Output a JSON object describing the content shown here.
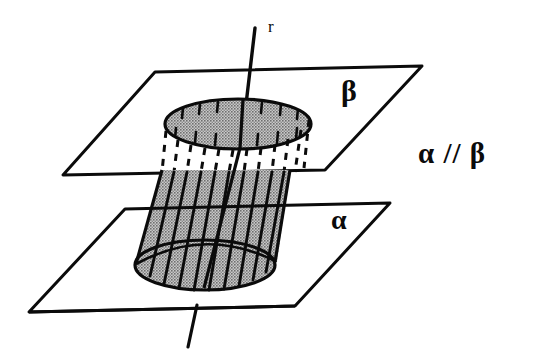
{
  "figure": {
    "background_color": "#ffffff",
    "ink_color": "#0b0b0b",
    "fill_color": "#9a9a9a",
    "width": 535,
    "height": 359
  },
  "labels": {
    "axis": "r",
    "upper_plane": "β",
    "lower_plane": "α",
    "relation": "α // β"
  },
  "geometry": {
    "upper_plane": {
      "name": "beta",
      "corners": [
        [
          155,
          72
        ],
        [
          422,
          66
        ],
        [
          325,
          170
        ],
        [
          63,
          175
        ]
      ]
    },
    "lower_plane": {
      "name": "alpha",
      "corners": [
        [
          125,
          209
        ],
        [
          390,
          203
        ],
        [
          295,
          306
        ],
        [
          29,
          312
        ]
      ]
    },
    "top_ellipse": {
      "cx": 238,
      "cy": 124,
      "rx": 73,
      "ry": 25
    },
    "bottom_ellipse": {
      "cx": 205,
      "cy": 265,
      "rx": 70,
      "ry": 25
    },
    "axis_line": {
      "x1": 255,
      "y1": 28,
      "x2": 188,
      "y2": 345
    },
    "hidden_segment": {
      "from_y": 124,
      "to_y": 172,
      "style": "dashed"
    },
    "ruling_count": 11
  }
}
